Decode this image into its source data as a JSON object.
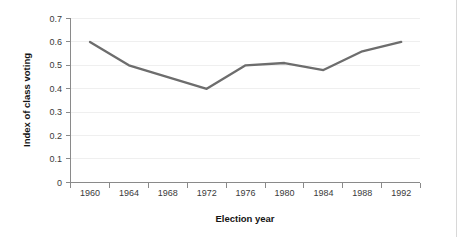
{
  "chart_data": {
    "type": "line",
    "title": "",
    "xlabel": "Election year",
    "ylabel": "Index of class voting",
    "categories": [
      "1960",
      "1964",
      "1968",
      "1972",
      "1976",
      "1980",
      "1984",
      "1988",
      "1992"
    ],
    "x": [
      1960,
      1964,
      1968,
      1972,
      1976,
      1980,
      1984,
      1988,
      1992
    ],
    "values": [
      0.6,
      0.5,
      0.45,
      0.4,
      0.5,
      0.51,
      0.48,
      0.56,
      0.6
    ],
    "series": [
      {
        "name": "Index of class voting",
        "values": [
          0.6,
          0.5,
          0.45,
          0.4,
          0.5,
          0.51,
          0.48,
          0.56,
          0.6
        ],
        "color": "#6d6d6d"
      }
    ],
    "ylim": [
      0,
      0.7
    ],
    "ytick_labels": [
      "0.7",
      "0.6",
      "0.5",
      "0.4",
      "0.3",
      "0.2",
      "0.1",
      "0"
    ],
    "ytick_values": [
      0.7,
      0.6,
      0.5,
      0.4,
      0.3,
      0.2,
      0.1,
      0
    ],
    "xlim": [
      1958,
      1994
    ],
    "grid": true,
    "grid_axis": "y",
    "legend": false,
    "line_color": "#6d6d6d",
    "grid_color": "#efefef",
    "axis_color": "#8a8a8a",
    "text_color": "#3a3a3a"
  }
}
